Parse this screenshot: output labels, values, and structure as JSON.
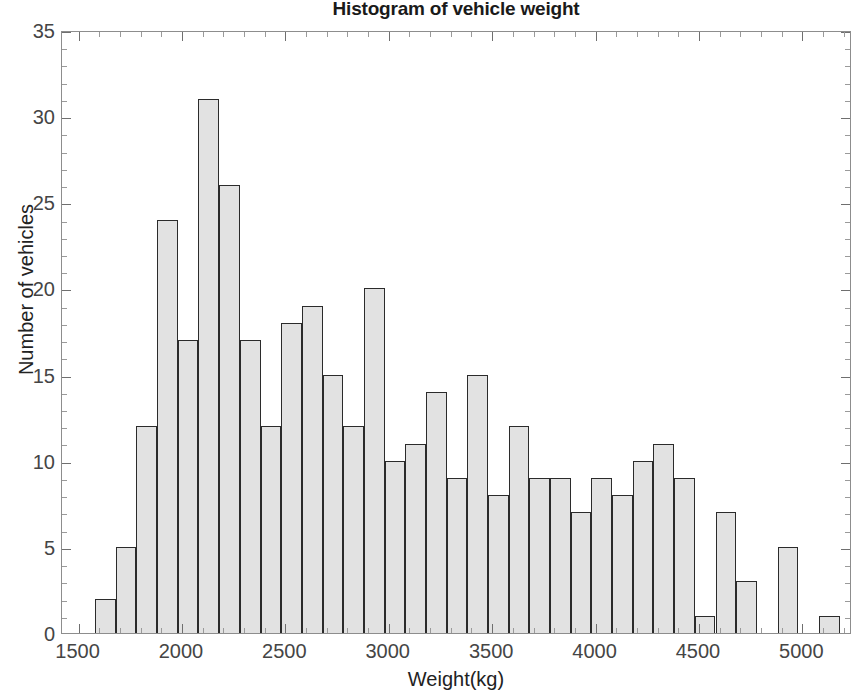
{
  "chart_data": {
    "type": "bar",
    "title": "Histogram of vehicle weight",
    "xlabel": "Weight(kg)",
    "ylabel": "Number of vehicles",
    "xlim": [
      1420,
      5240
    ],
    "ylim": [
      0,
      35
    ],
    "xticks": [
      1500,
      2000,
      2500,
      3000,
      3500,
      4000,
      4500,
      5000
    ],
    "xtick_labels": [
      "1500",
      "2000",
      "2500",
      "3000",
      "3500",
      "4000",
      "4500",
      "5000"
    ],
    "yticks": [
      0,
      5,
      10,
      15,
      20,
      25,
      30,
      35
    ],
    "ytick_labels": [
      "0",
      "5",
      "10",
      "15",
      "20",
      "25",
      "30",
      "35"
    ],
    "grid": false,
    "legend": null,
    "bin_width": 100,
    "bin_start": 1580,
    "bin_edges": [
      1580,
      1680,
      1780,
      1880,
      1980,
      2080,
      2180,
      2280,
      2380,
      2480,
      2580,
      2680,
      2780,
      2880,
      2980,
      3080,
      3180,
      3280,
      3380,
      3480,
      3580,
      3680,
      3780,
      3880,
      3980,
      4080,
      4180,
      4280,
      4380,
      4480,
      4580,
      4680,
      4780,
      4880,
      4980,
      5080,
      5180
    ],
    "categories": [
      "1580-1680",
      "1680-1780",
      "1780-1880",
      "1880-1980",
      "1980-2080",
      "2080-2180",
      "2180-2280",
      "2280-2380",
      "2380-2480",
      "2480-2580",
      "2580-2680",
      "2680-2780",
      "2780-2880",
      "2880-2980",
      "2980-3080",
      "3080-3180",
      "3180-3280",
      "3280-3380",
      "3380-3480",
      "3480-3580",
      "3580-3680",
      "3680-3780",
      "3780-3880",
      "3880-3980",
      "3980-4080",
      "4080-4180",
      "4180-4280",
      "4280-4380",
      "4380-4480",
      "4480-4580",
      "4580-4680",
      "4680-4780",
      "4780-4880",
      "4880-4980",
      "4980-5080",
      "5080-5180"
    ],
    "values": [
      2,
      5,
      12,
      24,
      17,
      31,
      26,
      17,
      12,
      18,
      19,
      15,
      12,
      20,
      10,
      11,
      14,
      9,
      15,
      8,
      12,
      9,
      9,
      7,
      9,
      8,
      10,
      11,
      9,
      1,
      7,
      3,
      0,
      5,
      0,
      1
    ],
    "bar_fill_color": "#e2e2e2",
    "bar_edge_color": "#2b2b2b",
    "axes_color": "#8d8d8d",
    "background_color": "#ffffff"
  }
}
